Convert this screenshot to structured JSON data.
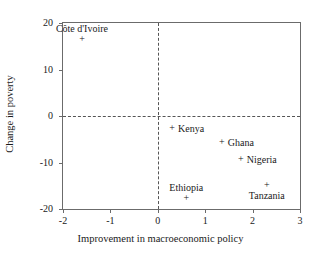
{
  "chart_data": {
    "type": "scatter",
    "title": "",
    "xlabel": "Improvement in macroeconomic policy",
    "ylabel": "Change in poverty",
    "xlim": [
      -2,
      3
    ],
    "ylim": [
      -20,
      20
    ],
    "xticks": [
      "-2",
      "-1",
      "0",
      "1",
      "2",
      "3"
    ],
    "xtick_values": [
      -2,
      -1,
      0,
      1,
      2,
      3
    ],
    "yticks": [
      "20",
      "10",
      "0",
      "-10",
      "-20"
    ],
    "ytick_values": [
      20,
      10,
      0,
      -10,
      -20
    ],
    "grid": false,
    "legend": "none",
    "marker": "+",
    "reference_lines": [
      {
        "axis": "y",
        "value": 0,
        "style": "dashed"
      },
      {
        "axis": "x",
        "value": 0,
        "style": "dashed"
      }
    ],
    "points": [
      {
        "label": "Côte d'Ivoire",
        "x": -1.6,
        "y": 16.5,
        "label_pos": "above"
      },
      {
        "label": "Kenya",
        "x": 0.3,
        "y": -2.6,
        "label_pos": "right"
      },
      {
        "label": "Ghana",
        "x": 1.35,
        "y": -5.6,
        "label_pos": "right"
      },
      {
        "label": "Nigeria",
        "x": 1.75,
        "y": -9.3,
        "label_pos": "right"
      },
      {
        "label": "Tanzania",
        "x": 2.3,
        "y": -14.9,
        "label_pos": "below"
      },
      {
        "label": "Ethiopia",
        "x": 0.6,
        "y": -17.6,
        "label_pos": "above"
      }
    ]
  }
}
